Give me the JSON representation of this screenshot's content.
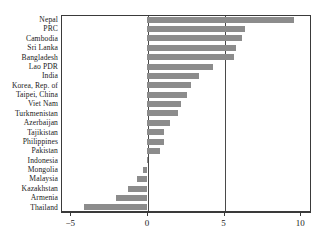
{
  "chart_data": {
    "type": "bar",
    "orientation": "horizontal",
    "title": "",
    "subtitle": "",
    "xlabel": "",
    "ylabel": "",
    "xlim": [
      -5.6,
      10.7
    ],
    "xticks": [
      -5,
      0,
      5,
      10
    ],
    "xticklabels": [
      "−5",
      "0",
      "5",
      "10"
    ],
    "grid": false,
    "reference_lines": [
      0,
      5
    ],
    "legend": "none",
    "bar_color": "#8c8c8c",
    "frame_color": "#3a3a3a",
    "categories": [
      "Nepal",
      "PRC",
      "Cambodia",
      "Sri Lanka",
      "Bangladesh",
      "Lao PDR",
      "India",
      "Korea, Rep. of",
      "Taipei, China",
      "Viet Nam",
      "Turkmenistan",
      "Azerbaijan",
      "Tajikistan",
      "Philippines",
      "Pakistan",
      "Indonesia",
      "Mongolia",
      "Malaysia",
      "Kazakhstan",
      "Armenia",
      "Thailand"
    ],
    "values": [
      9.6,
      6.4,
      6.2,
      5.8,
      5.7,
      4.3,
      3.4,
      2.9,
      2.6,
      2.2,
      2.0,
      1.5,
      1.1,
      1.1,
      0.85,
      0.05,
      -0.25,
      -0.65,
      -1.2,
      -2.0,
      -4.1
    ]
  }
}
